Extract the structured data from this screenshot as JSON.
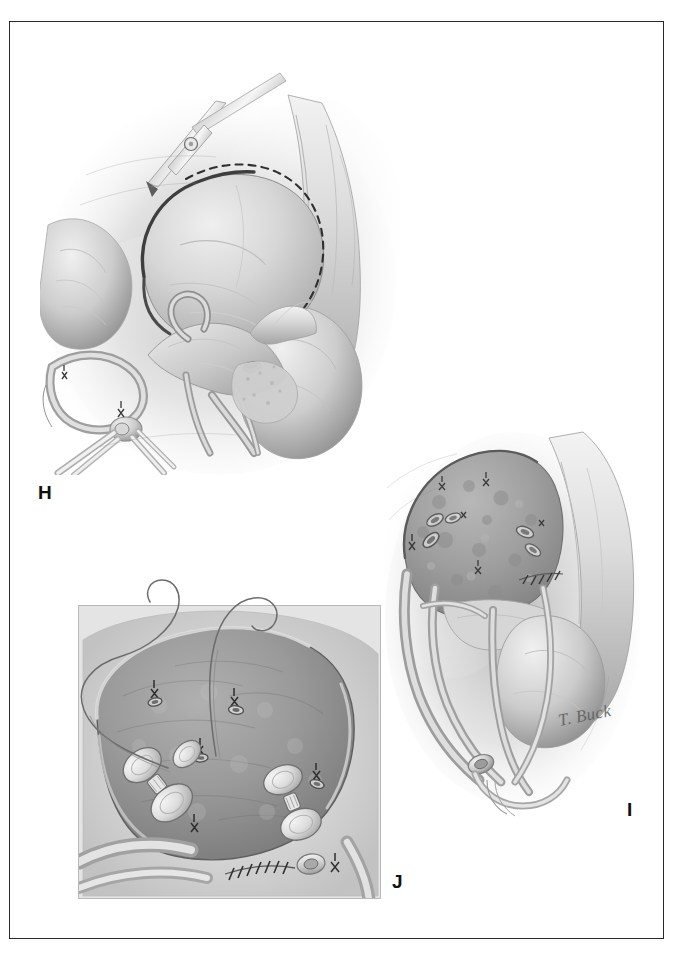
{
  "plate": {
    "kind": "surgical-illustration-plate",
    "medium": "grayscale pencil / airbrush medical illustration",
    "border_color": "#2a2a2a",
    "background_color": "#ffffff",
    "signature": "T. Buck",
    "panel_labels": [
      "H",
      "I",
      "J"
    ]
  },
  "panels": [
    {
      "id": "H",
      "label": "H",
      "label_position": {
        "x": 38,
        "y": 483
      },
      "title": "Atriotomy incision with scissors along dashed line",
      "description": "Operative field showing the right atrium opened along a dashed incision line with fine scissors; venous cannulae secured with purse-string ligatures enter the inferior vena cava at lower left; aorta, pulmonary artery and atrial appendage are displayed within the pericardial well.",
      "features": [
        "scissors-instrument",
        "dashed-incision-line",
        "opened-atrial-flap",
        "venous-cannula",
        "purse-string-suture",
        "great-vessels",
        "pericardial-retraction"
      ]
    },
    {
      "id": "I",
      "label": "I",
      "label_position": {
        "x": 627,
        "y": 800
      },
      "title": "Resected field with open vessel stumps",
      "description": "The chamber wall has been resected to expose a roughened endocardial surface with several transected coronary-vessel stumps; a continuous suture line closes the lower margin; the ventricular mass and great vessels lie below and to the right.",
      "features": [
        "resected-tissue-surface",
        "vessel-stump",
        "running-suture-line",
        "ligated-branch",
        "ventricular-mass",
        "retracted-pericardium"
      ]
    },
    {
      "id": "J",
      "label": "J",
      "label_position": {
        "x": 392,
        "y": 872
      },
      "title": "Close-up inset: pledgeted mattress sutures in the tissue bed",
      "description": "Magnified inset view of the tissue bed, framed as a rectangular close-up. Two pledgeted horizontal mattress sutures with long curved needle threads are placed, and several small tied knots and vessel orifices dot the surface; a continuous closure line runs along the lower border.",
      "features": [
        "inset-frame",
        "pledgeted-mattress-suture",
        "curved-needle-thread",
        "tied-knot",
        "vessel-orifice",
        "running-closure-line"
      ],
      "inset_frame": {
        "x": 78,
        "y": 605,
        "width": 303,
        "height": 294
      }
    }
  ],
  "palette": {
    "ink": "#2a2a2a",
    "tissue_light": "#e2e2e2",
    "tissue_mid": "#bdbdbd",
    "tissue_dark": "#8e8e8e",
    "tissue_deep": "#6d6d6d",
    "shadow": "#9a9a9a",
    "highlight": "#f4f4f4",
    "suture": "#4a4a4a"
  }
}
